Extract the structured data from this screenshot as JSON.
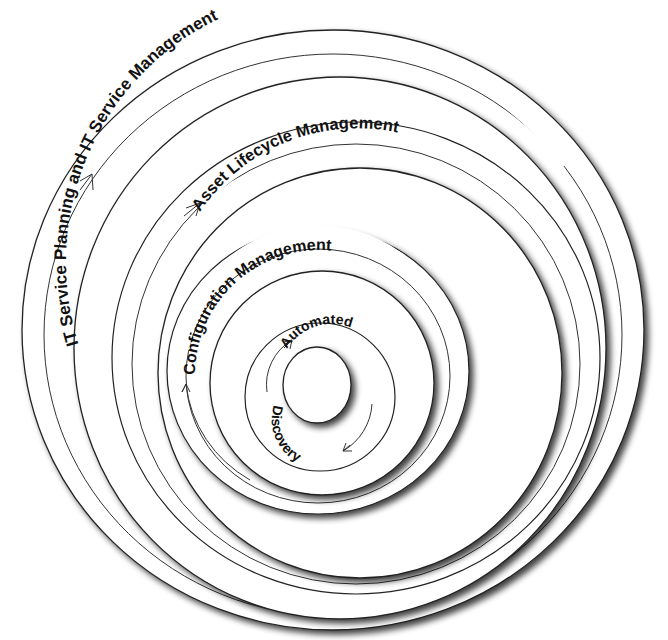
{
  "diagram": {
    "type": "nested-rings",
    "rings": [
      {
        "id": "it-service",
        "label": "IT Service Planning and IT Service Management",
        "order": 1,
        "outer": {
          "cx": 333,
          "cy": 330,
          "rx": 311,
          "ry": 300
        },
        "inner": {
          "cx": 340,
          "cy": 345,
          "rx": 268,
          "ry": 274
        },
        "guide": {
          "cx": 333,
          "cy": 335,
          "rx": 288,
          "ry": 282
        },
        "text_r": 268
      },
      {
        "id": "asset-lifecycle",
        "label": "Asset Lifecycle Management",
        "order": 2,
        "outer": {
          "cx": 355,
          "cy": 360,
          "rx": 243,
          "ry": 236
        },
        "inner": {
          "cx": 360,
          "cy": 372,
          "rx": 202,
          "ry": 206
        },
        "guide": {
          "cx": 355,
          "cy": 366,
          "rx": 224,
          "ry": 220
        },
        "text_r": 208
      },
      {
        "id": "configuration",
        "label": "Configuration Management",
        "order": 3,
        "outer": {
          "cx": 318,
          "cy": 372,
          "rx": 150,
          "ry": 143
        },
        "inner": {
          "cx": 322,
          "cy": 382,
          "rx": 112,
          "ry": 112
        },
        "guide": {
          "cx": 318,
          "cy": 376,
          "rx": 132,
          "ry": 127
        },
        "text_r": 118
      },
      {
        "id": "automated-discovery",
        "label_top": "Automated",
        "label_bottom": "Discovery",
        "order": 4,
        "outer": {
          "cx": 320,
          "cy": 397,
          "rx": 74,
          "ry": 73
        },
        "inner": {
          "cx": 317,
          "cy": 386,
          "rx": 34,
          "ry": 38
        },
        "guide": {
          "cx": 318,
          "cy": 393,
          "rx": 58,
          "ry": 58
        },
        "text_r": 47
      }
    ],
    "arrow_direction": "clockwise",
    "colors": {
      "line": "#222222",
      "text": "#111111",
      "background": "#ffffff",
      "shadow": "#555555"
    }
  }
}
